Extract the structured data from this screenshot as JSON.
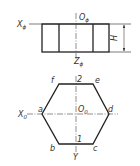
{
  "diagram": {
    "type": "orthographic-projection",
    "colors": {
      "outline": "#222222",
      "thin_line": "#444444",
      "text": "#333333",
      "background": "#ffffff"
    },
    "front_view": {
      "axis_x_label": "X",
      "axis_x_sub": "ϕ",
      "origin_label": "O",
      "origin_sub": "ϕ",
      "axis_z_label": "Z",
      "axis_z_sub": "ϕ",
      "dimension_label": "H"
    },
    "top_view": {
      "axis_x_label": "X",
      "axis_x_sub": "0",
      "origin_label": "O",
      "origin_sub": "0",
      "axis_y_label": "Y",
      "vertices": {
        "a": "a",
        "b": "b",
        "c": "c",
        "d": "d",
        "e": "e",
        "f": "f"
      },
      "point_top": "2",
      "point_bottom": "1"
    }
  }
}
